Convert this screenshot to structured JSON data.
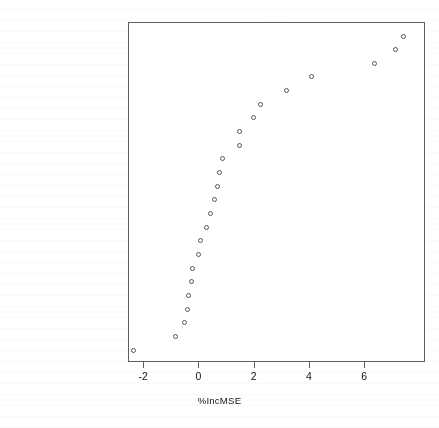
{
  "chart_data": {
    "type": "scatter",
    "title": "",
    "subtitle": "",
    "xlabel": "%IncMSE",
    "ylabel": "",
    "xlim": [
      -2.55,
      8.2
    ],
    "ylim": [
      0,
      26
    ],
    "grid": false,
    "legend": "none",
    "marker": "open-circle",
    "orientation": "horizontal-dotchart",
    "xticks": [
      -2,
      0,
      2,
      4,
      6
    ],
    "xticklabels": [
      "-2",
      "0",
      "2",
      "4",
      "6"
    ],
    "categories": [
      "app.a5d",
      "app.a4c",
      "app.a5c",
      "mood.l1",
      "app.a3c",
      "sms.c1c",
      "accelerometer.high",
      "sms.c5c",
      "mood.l2",
      "screen.n",
      "app.a1c",
      "app.a2c",
      "appCat.unknown.sum",
      "sms.c2c",
      "call.c5c",
      "screen.duration",
      "appCat.weather.n",
      "call.c1d",
      "image.n",
      "appCat.unknown.n",
      "appCat.builtin.n",
      "call.c5d",
      "call.c1c",
      "app.a1d"
    ],
    "values": [
      7.38,
      7.09,
      6.33,
      4.07,
      3.16,
      2.22,
      1.96,
      1.45,
      1.45,
      0.84,
      0.73,
      0.65,
      0.55,
      0.4,
      0.25,
      0.04,
      -0.04,
      -0.25,
      -0.29,
      -0.4,
      -0.44,
      -0.55,
      -0.87,
      -2.4
    ],
    "points": [
      {
        "label": "app.a5d",
        "value": 7.38
      },
      {
        "label": "app.a4c",
        "value": 7.09
      },
      {
        "label": "app.a5c",
        "value": 6.33
      },
      {
        "label": "mood.l1",
        "value": 4.07
      },
      {
        "label": "app.a3c",
        "value": 3.16
      },
      {
        "label": "sms.c1c",
        "value": 2.22
      },
      {
        "label": "accelerometer.high",
        "value": 1.96
      },
      {
        "label": "sms.c5c",
        "value": 1.45
      },
      {
        "label": "mood.l2",
        "value": 1.45
      },
      {
        "label": "screen.n",
        "value": 0.84
      },
      {
        "label": "app.a1c",
        "value": 0.73
      },
      {
        "label": "app.a2c",
        "value": 0.65
      },
      {
        "label": "appCat.unknown.sum",
        "value": 0.55
      },
      {
        "label": "sms.c2c",
        "value": 0.4
      },
      {
        "label": "call.c5c",
        "value": 0.25
      },
      {
        "label": "screen.duration",
        "value": 0.04
      },
      {
        "label": "appCat.weather.n",
        "value": -0.04
      },
      {
        "label": "call.c1d",
        "value": -0.25
      },
      {
        "label": "image.n",
        "value": -0.29
      },
      {
        "label": "appCat.unknown.n",
        "value": -0.4
      },
      {
        "label": "appCat.builtin.n",
        "value": -0.44
      },
      {
        "label": "call.c5d",
        "value": -0.55
      },
      {
        "label": "call.c1c",
        "value": -0.87
      },
      {
        "label": "app.a1d",
        "value": -2.4
      }
    ],
    "colors": {
      "marker_stroke": "#55565c",
      "axis": "#5e5e5e",
      "text": "#141414",
      "background": "#ffffff"
    }
  }
}
